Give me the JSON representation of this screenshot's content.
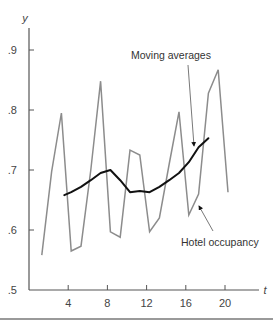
{
  "chart_data": {
    "type": "line",
    "title": "",
    "xlabel": "t",
    "ylabel": "y",
    "xlim": [
      0,
      22
    ],
    "ylim": [
      0.5,
      0.95
    ],
    "x_ticks": [
      4,
      8,
      12,
      16,
      20
    ],
    "x_tick_labels": [
      "4",
      "8",
      "12",
      "16",
      "20"
    ],
    "y_ticks": [
      0.5,
      0.6,
      0.7,
      0.8,
      0.9
    ],
    "y_tick_labels": [
      ".5",
      ".6",
      ".7",
      ".8",
      ".9"
    ],
    "grid": false,
    "legend": "annotations",
    "series": [
      {
        "name": "Hotel occupancy",
        "color": "#8c8c8c",
        "x": [
          1,
          2,
          3,
          4,
          5,
          6,
          7,
          8,
          9,
          10,
          11,
          12,
          13,
          14,
          15,
          16,
          17,
          18,
          19,
          20
        ],
        "values": [
          0.558,
          0.697,
          0.795,
          0.565,
          0.573,
          0.7,
          0.848,
          0.597,
          0.588,
          0.733,
          0.725,
          0.597,
          0.62,
          0.71,
          0.797,
          0.625,
          0.66,
          0.828,
          0.867,
          0.663
        ]
      },
      {
        "name": "Moving averages",
        "color": "#111111",
        "x": [
          3.3,
          4,
          5,
          6,
          7,
          8,
          9,
          10,
          11,
          12,
          13,
          14,
          15,
          16,
          17,
          18
        ],
        "values": [
          0.658,
          0.663,
          0.672,
          0.683,
          0.695,
          0.7,
          0.683,
          0.663,
          0.665,
          0.663,
          0.672,
          0.683,
          0.695,
          0.713,
          0.738,
          0.753
        ]
      }
    ],
    "annotations": [
      {
        "text": "Moving averages",
        "points_to": "Moving averages",
        "at_t": 16.8
      },
      {
        "text": "Hotel occupancy",
        "points_to": "Hotel occupancy",
        "at_t": 17
      }
    ]
  }
}
